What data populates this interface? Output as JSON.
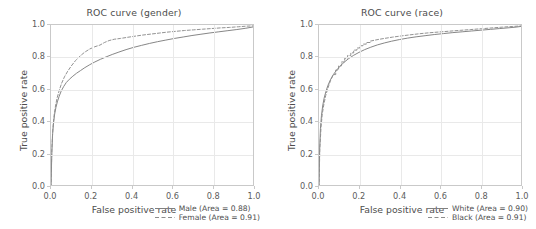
{
  "figure": {
    "background": "#ffffff",
    "axis_color": "#c9c9c9",
    "grid_color": "#e9e9e9",
    "solid_color": "#808080",
    "dashed_color": "#8c8c8c"
  },
  "chart_data": [
    {
      "type": "line",
      "title": "ROC curve (gender)",
      "xlabel": "False positive rate",
      "ylabel": "True positive rate",
      "xlim": [
        0.0,
        1.0
      ],
      "ylim": [
        0.0,
        1.0
      ],
      "xticks": [
        "0.0",
        "0.2",
        "0.4",
        "0.6",
        "0.8",
        "1.0"
      ],
      "yticks": [
        "0.0",
        "0.2",
        "0.4",
        "0.6",
        "0.8",
        "1.0"
      ],
      "xtick_values": [
        0.0,
        0.2,
        0.4,
        0.6,
        0.8,
        1.0
      ],
      "ytick_values": [
        0.0,
        0.2,
        0.4,
        0.6,
        0.8,
        1.0
      ],
      "grid": true,
      "legend_position": "lower right",
      "series": [
        {
          "name": "Male",
          "area": 0.88,
          "legend_label": "Male (Area = 0.88)",
          "style": "solid",
          "x": [
            0.0,
            0.004,
            0.008,
            0.013,
            0.018,
            0.024,
            0.031,
            0.04,
            0.05,
            0.062,
            0.075,
            0.09,
            0.107,
            0.125,
            0.145,
            0.166,
            0.19,
            0.215,
            0.242,
            0.27,
            0.3,
            0.333,
            0.368,
            0.405,
            0.443,
            0.482,
            0.522,
            0.563,
            0.605,
            0.648,
            0.691,
            0.735,
            0.779,
            0.823,
            0.867,
            0.911,
            0.955,
            1.0
          ],
          "y": [
            0.0,
            0.21,
            0.33,
            0.4,
            0.45,
            0.49,
            0.525,
            0.56,
            0.592,
            0.62,
            0.645,
            0.665,
            0.684,
            0.702,
            0.719,
            0.737,
            0.755,
            0.772,
            0.788,
            0.803,
            0.818,
            0.833,
            0.848,
            0.862,
            0.874,
            0.886,
            0.897,
            0.907,
            0.917,
            0.926,
            0.935,
            0.943,
            0.951,
            0.958,
            0.965,
            0.972,
            0.98,
            0.99
          ]
        },
        {
          "name": "Female",
          "area": 0.91,
          "legend_label": "Female (Area = 0.91)",
          "style": "dashed",
          "x": [
            0.0,
            0.004,
            0.009,
            0.015,
            0.022,
            0.03,
            0.04,
            0.052,
            0.066,
            0.082,
            0.1,
            0.12,
            0.142,
            0.165,
            0.19,
            0.215,
            0.24,
            0.262,
            0.285,
            0.31,
            0.34,
            0.375,
            0.412,
            0.45,
            0.49,
            0.53,
            0.57,
            0.612,
            0.655,
            0.698,
            0.742,
            0.786,
            0.83,
            0.874,
            0.918,
            0.96,
            1.0
          ],
          "y": [
            0.0,
            0.23,
            0.36,
            0.44,
            0.5,
            0.55,
            0.595,
            0.64,
            0.68,
            0.715,
            0.748,
            0.78,
            0.808,
            0.832,
            0.852,
            0.866,
            0.876,
            0.892,
            0.904,
            0.912,
            0.917,
            0.924,
            0.931,
            0.938,
            0.944,
            0.95,
            0.956,
            0.961,
            0.966,
            0.97,
            0.974,
            0.978,
            0.982,
            0.985,
            0.989,
            0.993,
            0.995
          ]
        }
      ]
    },
    {
      "type": "line",
      "title": "ROC curve (race)",
      "xlabel": "False positive rate",
      "ylabel": "True positive rate",
      "xlim": [
        0.0,
        1.0
      ],
      "ylim": [
        0.0,
        1.0
      ],
      "xticks": [
        "0.0",
        "0.2",
        "0.4",
        "0.6",
        "0.8",
        "1.0"
      ],
      "yticks": [
        "0.0",
        "0.2",
        "0.4",
        "0.6",
        "0.8",
        "1.0"
      ],
      "xtick_values": [
        0.0,
        0.2,
        0.4,
        0.6,
        0.8,
        1.0
      ],
      "ytick_values": [
        0.0,
        0.2,
        0.4,
        0.6,
        0.8,
        1.0
      ],
      "grid": true,
      "legend_position": "lower right",
      "series": [
        {
          "name": "White",
          "area": 0.9,
          "legend_label": "White (Area = 0.90)",
          "style": "solid",
          "x": [
            0.0,
            0.003,
            0.007,
            0.012,
            0.018,
            0.025,
            0.034,
            0.044,
            0.056,
            0.07,
            0.086,
            0.104,
            0.124,
            0.146,
            0.17,
            0.196,
            0.224,
            0.254,
            0.286,
            0.32,
            0.356,
            0.394,
            0.434,
            0.476,
            0.52,
            0.565,
            0.61,
            0.656,
            0.702,
            0.748,
            0.794,
            0.84,
            0.886,
            0.932,
            0.966,
            1.0
          ],
          "y": [
            0.0,
            0.23,
            0.36,
            0.44,
            0.5,
            0.548,
            0.59,
            0.628,
            0.662,
            0.693,
            0.721,
            0.747,
            0.771,
            0.793,
            0.813,
            0.831,
            0.848,
            0.863,
            0.877,
            0.889,
            0.9,
            0.91,
            0.919,
            0.927,
            0.934,
            0.941,
            0.947,
            0.953,
            0.958,
            0.963,
            0.968,
            0.973,
            0.978,
            0.983,
            0.987,
            0.993
          ]
        },
        {
          "name": "Black",
          "area": 0.91,
          "legend_label": "Black (Area = 0.91)",
          "style": "dashed",
          "jagged": true,
          "x": [
            0.0,
            0.004,
            0.01,
            0.016,
            0.024,
            0.033,
            0.044,
            0.056,
            0.07,
            0.082,
            0.082,
            0.096,
            0.096,
            0.11,
            0.11,
            0.126,
            0.126,
            0.14,
            0.14,
            0.156,
            0.156,
            0.17,
            0.17,
            0.186,
            0.186,
            0.2,
            0.2,
            0.216,
            0.216,
            0.232,
            0.232,
            0.25,
            0.25,
            0.272,
            0.296,
            0.325,
            0.36,
            0.4,
            0.445,
            0.492,
            0.54,
            0.59,
            0.64,
            0.692,
            0.744,
            0.796,
            0.848,
            0.9,
            0.95,
            1.0
          ],
          "y": [
            0.0,
            0.235,
            0.37,
            0.45,
            0.512,
            0.565,
            0.612,
            0.655,
            0.694,
            0.694,
            0.722,
            0.722,
            0.748,
            0.748,
            0.772,
            0.772,
            0.795,
            0.795,
            0.812,
            0.812,
            0.828,
            0.828,
            0.845,
            0.845,
            0.858,
            0.858,
            0.872,
            0.872,
            0.882,
            0.882,
            0.892,
            0.892,
            0.9,
            0.906,
            0.912,
            0.918,
            0.925,
            0.932,
            0.939,
            0.946,
            0.952,
            0.957,
            0.962,
            0.967,
            0.972,
            0.977,
            0.982,
            0.987,
            0.991,
            0.995
          ]
        }
      ]
    }
  ]
}
